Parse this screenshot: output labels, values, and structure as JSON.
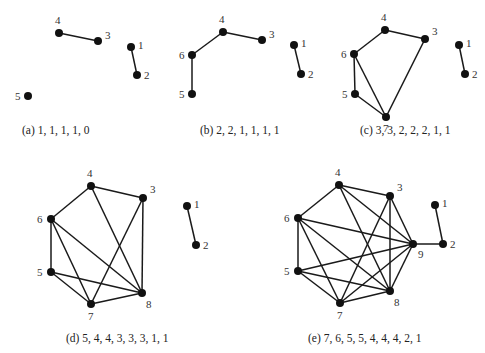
{
  "figure": {
    "colors": {
      "edge": "#1a1a1a",
      "node": "#111111",
      "label": "#333333",
      "background": "#ffffff"
    },
    "panels": [
      {
        "id": "a",
        "caption": "(a) 1, 1, 1, 1, 0",
        "caption_pos": [
          22,
          134
        ],
        "degree_sequence": [
          1,
          1,
          1,
          1,
          0
        ],
        "nodes": [
          {
            "id": "4",
            "x": 59,
            "y": 33,
            "lx": -4,
            "ly": -9
          },
          {
            "id": "3",
            "x": 98,
            "y": 41,
            "lx": 7,
            "ly": -2
          },
          {
            "id": "1",
            "x": 131,
            "y": 47,
            "lx": 7,
            "ly": 2
          },
          {
            "id": "2",
            "x": 137,
            "y": 75,
            "lx": 7,
            "ly": 4
          },
          {
            "id": "5",
            "x": 28,
            "y": 96,
            "lx": -13,
            "ly": 4
          }
        ],
        "edges": [
          [
            "4",
            "3"
          ],
          [
            "1",
            "2"
          ]
        ]
      },
      {
        "id": "b",
        "caption": "(b) 2, 2, 1, 1, 1, 1",
        "caption_pos": [
          200,
          134
        ],
        "degree_sequence": [
          2,
          2,
          1,
          1,
          1,
          1
        ],
        "nodes": [
          {
            "id": "4",
            "x": 223,
            "y": 32,
            "lx": -4,
            "ly": -9
          },
          {
            "id": "3",
            "x": 262,
            "y": 40,
            "lx": 7,
            "ly": -2
          },
          {
            "id": "6",
            "x": 192,
            "y": 55,
            "lx": -13,
            "ly": 4
          },
          {
            "id": "5",
            "x": 192,
            "y": 94,
            "lx": -13,
            "ly": 4
          },
          {
            "id": "1",
            "x": 294,
            "y": 45,
            "lx": 7,
            "ly": 2
          },
          {
            "id": "2",
            "x": 301,
            "y": 74,
            "lx": 7,
            "ly": 4
          }
        ],
        "edges": [
          [
            "4",
            "3"
          ],
          [
            "4",
            "6"
          ],
          [
            "6",
            "5"
          ],
          [
            "1",
            "2"
          ]
        ]
      },
      {
        "id": "c",
        "caption": "(c) 3, 3, 2, 2, 2, 1, 1",
        "caption_pos": [
          360,
          134
        ],
        "degree_sequence": [
          3,
          3,
          2,
          2,
          2,
          1,
          1
        ],
        "nodes": [
          {
            "id": "4",
            "x": 385,
            "y": 30,
            "lx": -4,
            "ly": -9
          },
          {
            "id": "3",
            "x": 425,
            "y": 39,
            "lx": 7,
            "ly": -4
          },
          {
            "id": "6",
            "x": 354,
            "y": 54,
            "lx": -13,
            "ly": 4
          },
          {
            "id": "5",
            "x": 355,
            "y": 94,
            "lx": -13,
            "ly": 4
          },
          {
            "id": "7",
            "x": 386,
            "y": 117,
            "lx": -3,
            "ly": 15
          },
          {
            "id": "1",
            "x": 459,
            "y": 45,
            "lx": 7,
            "ly": 2
          },
          {
            "id": "2",
            "x": 465,
            "y": 74,
            "lx": 7,
            "ly": 4
          }
        ],
        "edges": [
          [
            "4",
            "3"
          ],
          [
            "4",
            "6"
          ],
          [
            "6",
            "5"
          ],
          [
            "6",
            "7"
          ],
          [
            "5",
            "7"
          ],
          [
            "3",
            "7"
          ],
          [
            "1",
            "2"
          ]
        ]
      },
      {
        "id": "d",
        "caption": "(d) 5, 4, 4, 3, 3, 3, 1, 1",
        "caption_pos": [
          66,
          342
        ],
        "degree_sequence": [
          5,
          4,
          4,
          3,
          3,
          3,
          1,
          1
        ],
        "nodes": [
          {
            "id": "4",
            "x": 91,
            "y": 186,
            "lx": -4,
            "ly": -9
          },
          {
            "id": "3",
            "x": 143,
            "y": 198,
            "lx": 7,
            "ly": -5
          },
          {
            "id": "6",
            "x": 51,
            "y": 219,
            "lx": -14,
            "ly": 4
          },
          {
            "id": "5",
            "x": 51,
            "y": 272,
            "lx": -14,
            "ly": 4
          },
          {
            "id": "7",
            "x": 91,
            "y": 304,
            "lx": -3,
            "ly": 16
          },
          {
            "id": "8",
            "x": 142,
            "y": 293,
            "lx": 4,
            "ly": 15
          },
          {
            "id": "1",
            "x": 187,
            "y": 206,
            "lx": 7,
            "ly": 2
          },
          {
            "id": "2",
            "x": 196,
            "y": 245,
            "lx": 7,
            "ly": 4
          }
        ],
        "edges": [
          [
            "4",
            "3"
          ],
          [
            "4",
            "6"
          ],
          [
            "4",
            "8"
          ],
          [
            "3",
            "8"
          ],
          [
            "3",
            "7"
          ],
          [
            "6",
            "5"
          ],
          [
            "6",
            "7"
          ],
          [
            "6",
            "8"
          ],
          [
            "5",
            "8"
          ],
          [
            "5",
            "7"
          ],
          [
            "7",
            "8"
          ],
          [
            "1",
            "2"
          ]
        ]
      },
      {
        "id": "e",
        "caption": "(e) 7, 6, 5, 5, 4, 4, 4, 2, 1",
        "caption_pos": [
          308,
          342
        ],
        "degree_sequence": [
          7,
          6,
          5,
          5,
          4,
          4,
          4,
          2,
          1
        ],
        "nodes": [
          {
            "id": "4",
            "x": 339,
            "y": 185,
            "lx": -4,
            "ly": -9
          },
          {
            "id": "3",
            "x": 390,
            "y": 196,
            "lx": 7,
            "ly": -5
          },
          {
            "id": "6",
            "x": 298,
            "y": 218,
            "lx": -14,
            "ly": 4
          },
          {
            "id": "5",
            "x": 298,
            "y": 271,
            "lx": -14,
            "ly": 4
          },
          {
            "id": "7",
            "x": 340,
            "y": 303,
            "lx": -3,
            "ly": 16
          },
          {
            "id": "8",
            "x": 390,
            "y": 291,
            "lx": 4,
            "ly": 15
          },
          {
            "id": "9",
            "x": 413,
            "y": 244,
            "lx": 5,
            "ly": 14
          },
          {
            "id": "1",
            "x": 435,
            "y": 205,
            "lx": 7,
            "ly": 2
          },
          {
            "id": "2",
            "x": 443,
            "y": 244,
            "lx": 7,
            "ly": 4
          }
        ],
        "edges": [
          [
            "4",
            "3"
          ],
          [
            "4",
            "6"
          ],
          [
            "4",
            "8"
          ],
          [
            "4",
            "9"
          ],
          [
            "3",
            "8"
          ],
          [
            "3",
            "7"
          ],
          [
            "3",
            "9"
          ],
          [
            "6",
            "5"
          ],
          [
            "6",
            "7"
          ],
          [
            "6",
            "8"
          ],
          [
            "6",
            "9"
          ],
          [
            "5",
            "8"
          ],
          [
            "5",
            "7"
          ],
          [
            "5",
            "9"
          ],
          [
            "7",
            "8"
          ],
          [
            "7",
            "9"
          ],
          [
            "8",
            "9"
          ],
          [
            "9",
            "2"
          ],
          [
            "1",
            "2"
          ]
        ]
      }
    ]
  }
}
